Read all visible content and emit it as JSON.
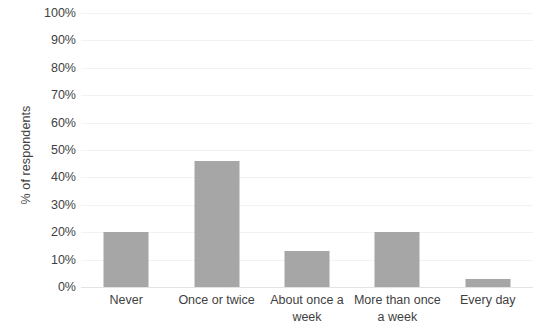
{
  "chart_data": {
    "type": "bar",
    "title": "",
    "subtitle": "",
    "xlabel": "",
    "ylabel": "% of respondents",
    "categories": [
      "Never",
      "Once or twice",
      "About once a week",
      "More than once a week",
      "Every day"
    ],
    "values": [
      20,
      46,
      13,
      20,
      3
    ],
    "value_labels": [
      "20%",
      "46%",
      "13%",
      "20%",
      "3%"
    ],
    "ylim": [
      0,
      100
    ],
    "ytick_labels": [
      "100%",
      "90%",
      "80%",
      "70%",
      "60%",
      "50%",
      "40%",
      "30%",
      "20%",
      "10%",
      "0%"
    ],
    "ytick_values": [
      100,
      90,
      80,
      70,
      60,
      50,
      40,
      30,
      20,
      10,
      0
    ],
    "grid": true,
    "legend": false,
    "legend_position": "none",
    "bar_color": "#a6a6a6",
    "gridline_color": "#f2f2f2",
    "text_color": "#3f3f3f",
    "background_color": "#ffffff"
  }
}
